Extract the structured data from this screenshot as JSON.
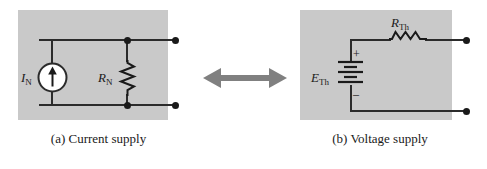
{
  "figure": {
    "name": "norton-thevenin-equivalent-supplies",
    "background_color": "#ffffff",
    "panel_fill_color": "#c9c9c9",
    "wire_color": "#2b2b2b",
    "arrow_color": "#808080"
  },
  "panel_a": {
    "caption": "(a) Current supply",
    "source": {
      "icon": "current-source-icon",
      "label_main": "I",
      "label_sub": "N",
      "arrow_direction": "up"
    },
    "resistor": {
      "icon": "resistor-zigzag-icon",
      "orientation": "vertical",
      "label_main": "R",
      "label_sub": "N"
    },
    "terminals": [
      {
        "name": "top-terminal",
        "position": "top-right"
      },
      {
        "name": "bottom-terminal",
        "position": "bottom-right"
      }
    ],
    "junctions": [
      {
        "name": "top-junction"
      },
      {
        "name": "bottom-junction"
      }
    ]
  },
  "panel_b": {
    "caption": "(b) Voltage supply",
    "source": {
      "icon": "battery-icon",
      "label_main": "E",
      "label_sub": "Th",
      "polarity_positive": "+",
      "polarity_negative": "–"
    },
    "resistor": {
      "icon": "resistor-zigzag-icon",
      "orientation": "horizontal",
      "label_main": "R",
      "label_sub": "Th"
    },
    "terminals": [
      {
        "name": "top-terminal",
        "position": "top-right"
      },
      {
        "name": "bottom-terminal",
        "position": "bottom-right"
      }
    ]
  },
  "equivalence": {
    "icon": "double-headed-arrow-icon",
    "direction": "left-right"
  }
}
